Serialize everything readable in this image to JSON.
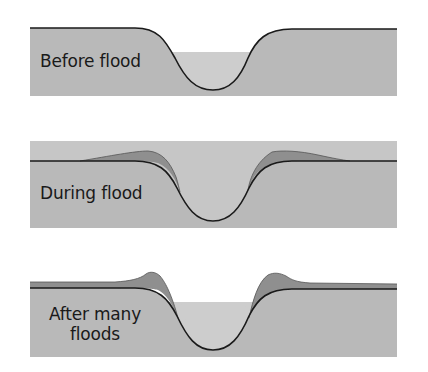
{
  "diagram": {
    "type": "cross-section sequence",
    "colors": {
      "ground": "#b9b9b9",
      "water": "#cdcdcd",
      "flood_water": "#c6c6c6",
      "deposit": "#8f8f8f",
      "outline": "#1a1a1a",
      "background": "#ffffff"
    },
    "panels": [
      {
        "id": "before",
        "label": "Before flood",
        "description": "Flat floodplain with channel; water level below bank tops"
      },
      {
        "id": "during",
        "label": "During flood",
        "description": "Water over entire floodplain; sediment deposited thickest near channel banks"
      },
      {
        "id": "after",
        "label": "After many floods",
        "label_lines": [
          "After many",
          "floods"
        ],
        "description": "Raised natural levees built up beside the channel"
      }
    ]
  }
}
